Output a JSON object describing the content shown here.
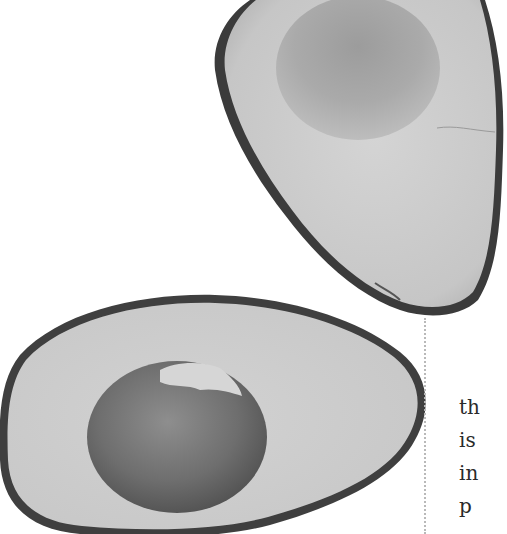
{
  "page": {
    "background": "#ffffff",
    "images": [
      {
        "name": "avocado-half-top",
        "description": "Halved avocado, pit removed, grayscale photo"
      },
      {
        "name": "avocado-half-bottom",
        "description": "Halved avocado with pit, grayscale photo"
      }
    ],
    "divider": {
      "style": "dotted",
      "color": "#b9b9b9"
    },
    "text_column": {
      "lines": [
        "th",
        "is",
        "in",
        "p"
      ]
    }
  }
}
